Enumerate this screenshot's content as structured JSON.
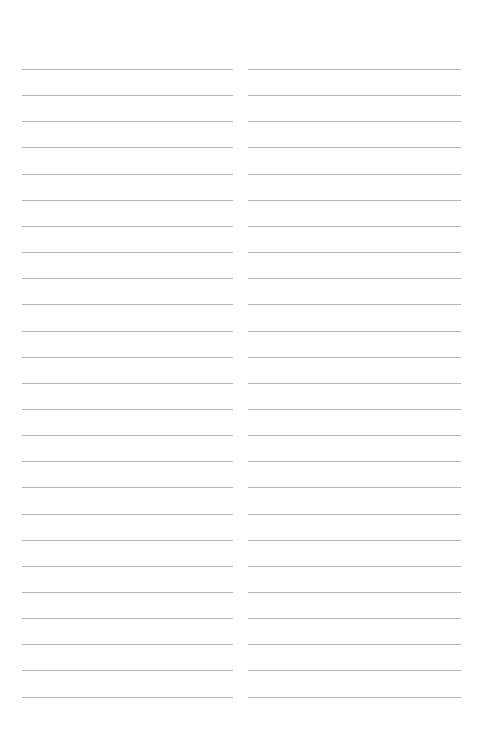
{
  "page": {
    "type": "lined-notepaper",
    "background_color": "#ffffff",
    "line_color": "#b4b4b4",
    "columns": 2,
    "lines_per_column": 25,
    "first_line_y": 69,
    "line_spacing": 26.15
  }
}
